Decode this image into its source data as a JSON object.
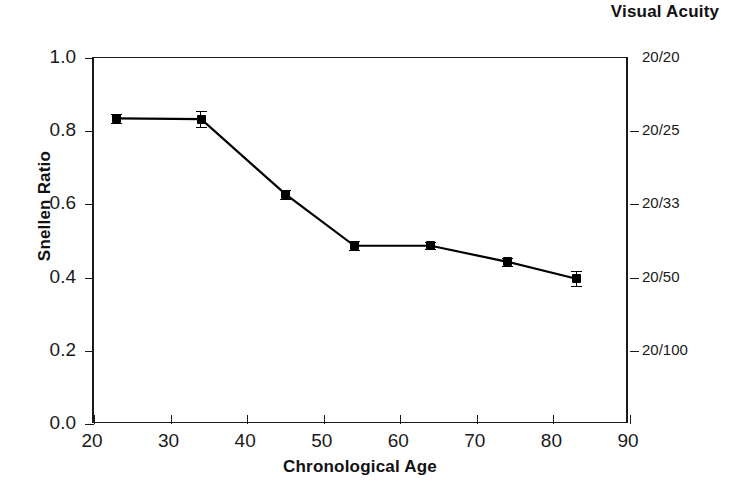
{
  "chart_data": {
    "type": "line",
    "title": "",
    "xlabel": "Chronological Age",
    "ylabel": "Snellen Ratio",
    "y2label": "Visual Acuity",
    "xlim": [
      20,
      90
    ],
    "ylim": [
      0.0,
      1.0
    ],
    "grid": false,
    "legend": "none",
    "xticks": [
      20,
      30,
      40,
      50,
      60,
      70,
      80,
      90
    ],
    "xticklabels": [
      "20",
      "30",
      "40",
      "50",
      "60",
      "70",
      "80",
      "90"
    ],
    "yticks": [
      0.0,
      0.2,
      0.4,
      0.6,
      0.8,
      1.0
    ],
    "yticklabels": [
      "0.0",
      "0.2",
      "0.4",
      "0.6",
      "0.8",
      "1.0"
    ],
    "y2ticks": [
      1.0,
      0.8,
      0.6,
      0.4,
      0.2
    ],
    "y2ticklabels": [
      "20/20",
      "20/25",
      "20/33",
      "20/50",
      "20/100"
    ],
    "series": [
      {
        "name": "Snellen Ratio",
        "marker": "filled-square",
        "color": "#000000",
        "x": [
          23,
          34,
          45,
          54,
          64,
          74,
          83
        ],
        "values": [
          0.835,
          0.833,
          0.628,
          0.487,
          0.487,
          0.443,
          0.397
        ],
        "yerr": [
          0.012,
          0.022,
          0.012,
          0.012,
          0.01,
          0.01,
          0.02
        ]
      }
    ]
  },
  "axis": {
    "left_title": "Snellen Ratio",
    "right_title": "Visual Acuity",
    "bottom_title": "Chronological Age"
  },
  "colors": {
    "line": "#000000",
    "axis": "#1a1a1a",
    "background": "#ffffff"
  }
}
